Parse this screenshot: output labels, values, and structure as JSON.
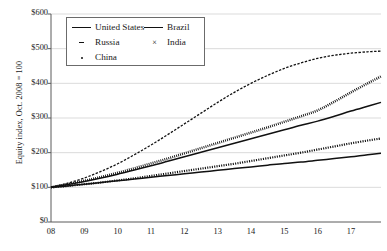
{
  "chart_data": {
    "type": "line",
    "title": "",
    "xlabel": "",
    "ylabel": "Equity index, Oct. 2008 = 100",
    "xlim": [
      2008,
      2017.9
    ],
    "ylim": [
      0,
      600
    ],
    "grid": true,
    "legend_position": "top-left",
    "ytick_labels": [
      "$600",
      "$500",
      "$400",
      "$300",
      "$200",
      "$100",
      "$0"
    ],
    "ytick_values": [
      600,
      500,
      400,
      300,
      200,
      100,
      0
    ],
    "xtick_labels": [
      "08",
      "09",
      "10",
      "11",
      "12",
      "13",
      "14",
      "15",
      "16",
      "17"
    ],
    "xtick_values": [
      2008,
      2009,
      2010,
      2011,
      2012,
      2013,
      2014,
      2015,
      2016,
      2017
    ],
    "x": [
      2008,
      2008.5,
      2009,
      2009.5,
      2010,
      2010.5,
      2011,
      2011.5,
      2012,
      2012.5,
      2013,
      2013.5,
      2014,
      2014.5,
      2015,
      2015.5,
      2016,
      2016.5,
      2017,
      2017.5,
      2017.9
    ],
    "series": [
      {
        "name": "United States",
        "style": "solid",
        "marker": "none",
        "color": "#111111",
        "values": [
          100,
          104,
          109,
          114,
          119,
          124,
          129,
          134,
          139,
          144,
          149,
          154,
          159,
          164,
          169,
          173,
          178,
          183,
          188,
          194,
          198
        ]
      },
      {
        "name": "Brazil",
        "style": "solid",
        "marker": "none",
        "color": "#111111",
        "values": [
          100,
          108,
          117,
          127,
          138,
          150,
          162,
          175,
          188,
          201,
          214,
          227,
          240,
          253,
          266,
          279,
          291,
          305,
          320,
          334,
          345
        ]
      },
      {
        "name": "Russia",
        "style": "dashed",
        "marker": "dash",
        "color": "#111111",
        "values": [
          100,
          112,
          127,
          146,
          168,
          194,
          222,
          252,
          283,
          314,
          345,
          374,
          400,
          423,
          443,
          459,
          472,
          481,
          487,
          491,
          493
        ]
      },
      {
        "name": "India",
        "style": "dotted",
        "marker": "x",
        "color": "#111111",
        "values": [
          100,
          109,
          119,
          130,
          142,
          155,
          169,
          183,
          198,
          213,
          228,
          243,
          258,
          273,
          289,
          305,
          322,
          347,
          374,
          400,
          420
        ]
      },
      {
        "name": "China",
        "style": "dotted",
        "marker": "plus",
        "color": "#111111",
        "values": [
          100,
          104,
          109,
          114,
          120,
          126,
          133,
          140,
          147,
          154,
          161,
          168,
          176,
          184,
          192,
          200,
          209,
          218,
          227,
          235,
          241
        ]
      }
    ],
    "legend_entries": [
      {
        "label": "United States",
        "key": "solid-line"
      },
      {
        "label": "Brazil",
        "key": "solid-line"
      },
      {
        "label": "Russia",
        "key": "dash-marker"
      },
      {
        "label": "India",
        "key": "x-marker"
      },
      {
        "label": "China",
        "key": "dot-marker"
      }
    ]
  },
  "axes": {
    "y_title": "Equity index, Oct. 2008 = 100"
  }
}
